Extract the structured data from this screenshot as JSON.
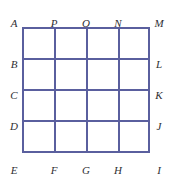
{
  "figure": {
    "background_color": "#ffffff",
    "line_color": "#5a5f9e",
    "label_color": "#2f2f33",
    "grid": {
      "rows": 4,
      "columns": 4,
      "cell_width": 32,
      "cell_height": 31.5,
      "origin_x": 22,
      "origin_y": 27,
      "width": 128,
      "height": 126,
      "vertical_line_offsets": [
        0,
        32,
        64,
        96,
        126
      ],
      "horizontal_line_offsets": [
        0,
        31,
        62,
        93,
        124
      ]
    },
    "labels": {
      "top": [
        {
          "text": "A",
          "x": 14,
          "y": 18
        },
        {
          "text": "P",
          "x": 54,
          "y": 18
        },
        {
          "text": "O",
          "x": 86,
          "y": 18
        },
        {
          "text": "N",
          "x": 118,
          "y": 18
        },
        {
          "text": "M",
          "x": 159,
          "y": 18
        }
      ],
      "left": [
        {
          "text": "B",
          "x": 14,
          "y": 59
        },
        {
          "text": "C",
          "x": 14,
          "y": 90
        },
        {
          "text": "D",
          "x": 14,
          "y": 121
        }
      ],
      "right": [
        {
          "text": "L",
          "x": 159,
          "y": 59
        },
        {
          "text": "K",
          "x": 159,
          "y": 90
        },
        {
          "text": "J",
          "x": 159,
          "y": 121
        }
      ],
      "bottom": [
        {
          "text": "E",
          "x": 14,
          "y": 165
        },
        {
          "text": "F",
          "x": 54,
          "y": 165
        },
        {
          "text": "G",
          "x": 86,
          "y": 165
        },
        {
          "text": "H",
          "x": 118,
          "y": 165
        },
        {
          "text": "I",
          "x": 159,
          "y": 165
        }
      ]
    }
  }
}
